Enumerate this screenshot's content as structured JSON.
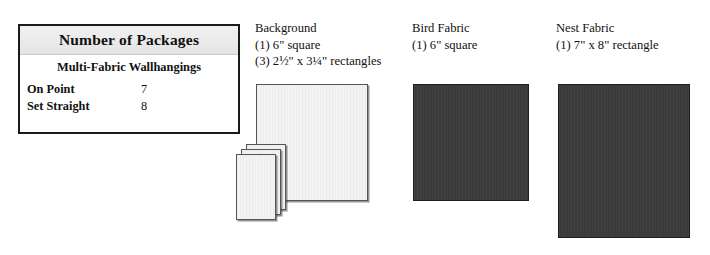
{
  "packages_table": {
    "title": "Number of Packages",
    "subtitle": "Multi-Fabric Wallhangings",
    "rows": [
      {
        "label": "On Point",
        "value": "7"
      },
      {
        "label": "Set Straight",
        "value": "8"
      }
    ]
  },
  "fabrics": [
    {
      "name": "Background",
      "lines": [
        "(1) 6\" square",
        "(3) 2½\" x 3¼\" rectangles"
      ],
      "swatch_color": "#f3f3f3"
    },
    {
      "name": "Bird Fabric",
      "lines": [
        "(1) 6\" square"
      ],
      "swatch_color": "#3a3a3a"
    },
    {
      "name": "Nest Fabric",
      "lines": [
        "(1) 7\" x 8\" rectangle"
      ],
      "swatch_color": "#3a3a3a"
    }
  ]
}
